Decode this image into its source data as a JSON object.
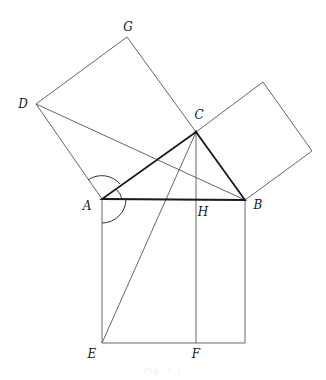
{
  "diagram": {
    "points": {
      "A": {
        "x": 102,
        "y": 199
      },
      "B": {
        "x": 245,
        "y": 200
      },
      "C": {
        "x": 196,
        "y": 132
      },
      "D": {
        "x": 36,
        "y": 104
      },
      "G": {
        "x": 127,
        "y": 37
      },
      "H": {
        "x": 196,
        "y": 200
      },
      "E": {
        "x": 102,
        "y": 343
      },
      "F": {
        "x": 196,
        "y": 343
      },
      "K": {
        "x": 245,
        "y": 343
      },
      "P1": {
        "x": 263,
        "y": 82
      },
      "P2": {
        "x": 312,
        "y": 151
      }
    },
    "labels": [
      {
        "id": "G",
        "text": "G",
        "x": 128,
        "y": 27
      },
      {
        "id": "D",
        "text": "D",
        "x": 23,
        "y": 104
      },
      {
        "id": "C",
        "text": "C",
        "x": 199,
        "y": 115
      },
      {
        "id": "A",
        "text": "A",
        "x": 87,
        "y": 206
      },
      {
        "id": "H",
        "text": "H",
        "x": 203,
        "y": 212
      },
      {
        "id": "B",
        "text": "B",
        "x": 258,
        "y": 205
      },
      {
        "id": "E",
        "text": "E",
        "x": 92,
        "y": 354
      },
      {
        "id": "F",
        "text": "F",
        "x": 196,
        "y": 354
      }
    ],
    "caption": "Fig. 1.1"
  }
}
